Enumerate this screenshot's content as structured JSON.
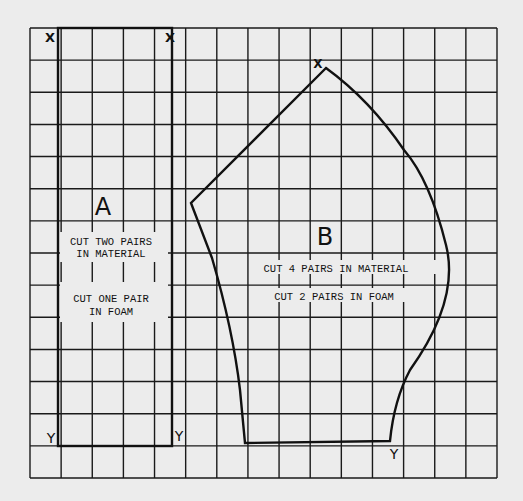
{
  "diagram": {
    "type": "sewing-pattern-grid",
    "grid": {
      "left": 30,
      "top": 28,
      "right": 497,
      "bottom": 478,
      "columns": 15,
      "rows": 14,
      "line_color": "#1a1a1a",
      "paper_color": "#ececec"
    },
    "pieces": [
      {
        "id": "A",
        "label": "A",
        "shape": "rectangle",
        "corner_markers": {
          "top_left": "X",
          "top_right": "X",
          "bottom_left": "Y",
          "bottom_right": "Y"
        },
        "instructions": [
          "CUT TWO PAIRS",
          "IN MATERIAL",
          "CUT ONE PAIR",
          "IN FOAM"
        ]
      },
      {
        "id": "B",
        "label": "B",
        "shape": "curved-polygon",
        "corner_markers": {
          "top": "X",
          "bottom_right": "Y"
        },
        "instructions": [
          "CUT 4 PAIRS IN MATERIAL",
          "CUT 2 PAIRS IN FOAM"
        ]
      }
    ]
  }
}
